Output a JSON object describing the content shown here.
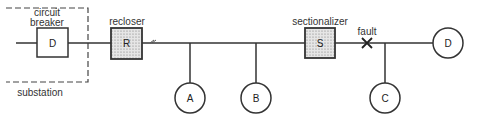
{
  "diagram": {
    "title": "",
    "colors": {
      "line": "#333333",
      "stipple_fill": "#d8d8d8",
      "background": "#ffffff"
    },
    "labels": {
      "circuit_breaker_line1": "circuit",
      "circuit_breaker_line2": "breaker",
      "substation": "substation",
      "recloser": "recloser",
      "sectionalizer": "sectionalizer",
      "fault": "fault"
    },
    "devices": {
      "breaker": {
        "letter": "D"
      },
      "recloser": {
        "letter": "R"
      },
      "sectionalizer": {
        "letter": "S"
      }
    },
    "loads": [
      {
        "letter": "A"
      },
      {
        "letter": "B"
      },
      {
        "letter": "C"
      },
      {
        "letter": "D"
      }
    ]
  }
}
